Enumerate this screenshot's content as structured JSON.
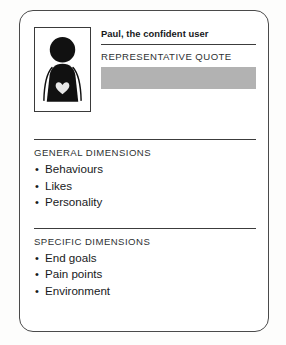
{
  "card": {
    "persona_name": "Paul, the confident user",
    "avatar": {
      "icon": "person-silhouette-with-heart-icon"
    },
    "quote": {
      "label": "REPRESENTATIVE QUOTE",
      "placeholder_value": ""
    },
    "sections": [
      {
        "title": "GENERAL DIMENSIONS",
        "items": [
          "Behaviours",
          "Likes",
          "Personality"
        ]
      },
      {
        "title": "SPECIFIC DIMENSIONS",
        "items": [
          "End goals",
          "Pain points",
          "Environment"
        ]
      }
    ]
  },
  "colors": {
    "card_border": "#4a4a4a",
    "rule": "#3c3c3c",
    "placeholder_gray": "#b2b2b2",
    "figure_black": "#111111",
    "heart_fill": "#e8e8e8",
    "page_background": "#fdfdfc"
  }
}
